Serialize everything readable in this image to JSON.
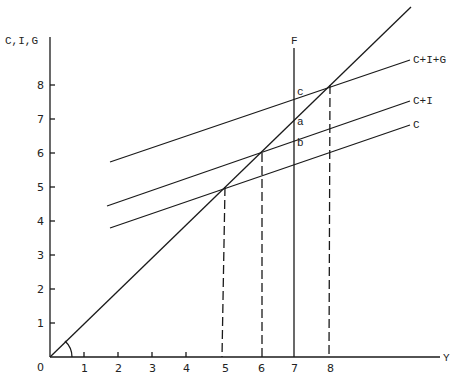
{
  "diagram": {
    "type": "keynesian-cross",
    "y_axis_label": "C,I,G",
    "x_axis_label": "Y",
    "origin_label": "0",
    "x_ticks": [
      "1",
      "2",
      "3",
      "4",
      "5",
      "6",
      "7",
      "8"
    ],
    "y_ticks": [
      "1",
      "2",
      "3",
      "4",
      "5",
      "6",
      "7",
      "8"
    ],
    "vertical_line_label": "F",
    "curves": [
      {
        "name": "C+I+G",
        "label": "C+I+G",
        "start": [
          1.7,
          5.7
        ],
        "end": [
          10.3,
          8.6
        ],
        "equilibrium": [
          8,
          8
        ]
      },
      {
        "name": "C+I",
        "label": "C+I",
        "start": [
          1.6,
          4.4
        ],
        "end": [
          10.3,
          7.4
        ],
        "equilibrium": [
          6,
          6
        ]
      },
      {
        "name": "C",
        "label": "C",
        "start": [
          1.7,
          3.7
        ],
        "end": [
          10.3,
          6.7
        ],
        "equilibrium": [
          5,
          5
        ]
      }
    ],
    "forty_five_line": {
      "start": [
        0,
        0
      ],
      "end": [
        10.3,
        10.3
      ]
    },
    "points": [
      {
        "label": "c",
        "x": 7,
        "y": 7.7
      },
      {
        "label": "a",
        "x": 7,
        "y": 6.9
      },
      {
        "label": "b",
        "x": 7,
        "y": 6.3
      }
    ],
    "dashed_drops": [
      5,
      6,
      8
    ],
    "f_line_x": 7
  }
}
